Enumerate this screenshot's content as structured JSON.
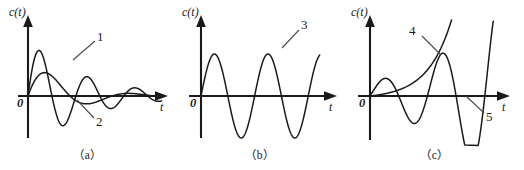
{
  "figure": {
    "background": "#ffffff",
    "ink_color": "#1a1a1a",
    "leader_color": "#4a4a52",
    "width": 524,
    "height": 170
  },
  "panels": [
    {
      "id": "a",
      "caption": "（a）",
      "y_axis_label": "c(t)",
      "x_axis_label": "t",
      "origin_label": "0",
      "curve_labels": [
        {
          "text": "1",
          "x": 97,
          "y": 36
        },
        {
          "text": "2",
          "x": 96,
          "y": 121
        }
      ],
      "description": "two damped oscillatory step responses decaying to zero"
    },
    {
      "id": "b",
      "caption": "（b）",
      "y_axis_label": "c(t)",
      "x_axis_label": "t",
      "origin_label": "0",
      "curve_labels": [
        {
          "text": "3",
          "x": 126,
          "y": 24
        }
      ],
      "description": "undamped constant-amplitude sinusoidal oscillation"
    },
    {
      "id": "c",
      "caption": "（c）",
      "y_axis_label": "c(t)",
      "x_axis_label": "t",
      "origin_label": "0",
      "curve_labels": [
        {
          "text": "4",
          "x": 64,
          "y": 30
        },
        {
          "text": "5",
          "x": 141,
          "y": 116
        }
      ],
      "description": "monotonically divergent curve and a divergent growing oscillation"
    }
  ],
  "chart_data": [
    {
      "type": "line",
      "panel": "a",
      "title": "(a)",
      "xlabel": "t",
      "ylabel": "c(t)",
      "grid": false,
      "axes": {
        "x0": 28,
        "y0": 96,
        "x_end": 166,
        "y_top": 18,
        "y_bottom": 138
      },
      "series": [
        {
          "name": "1",
          "model": "damped oscillation, low frequency, large damping",
          "amplitude": 38,
          "decay": 0.55,
          "omega": 3.05,
          "t_max": 6.3,
          "x_px_per_t": 21.2
        },
        {
          "name": "2",
          "model": "damped oscillation, higher frequency, light damping",
          "amplitude": 56,
          "decay": 0.38,
          "omega": 5.35,
          "t_max": 6.3,
          "x_px_per_t": 21.2
        }
      ]
    },
    {
      "type": "line",
      "panel": "b",
      "title": "(b)",
      "xlabel": "t",
      "ylabel": "c(t)",
      "grid": false,
      "axes": {
        "x0": 26,
        "y0": 96,
        "x_end": 160,
        "y_top": 18,
        "y_bottom": 138
      },
      "series": [
        {
          "name": "3",
          "model": "sustained sinusoid, constant amplitude",
          "amplitude": 42,
          "decay": 0,
          "omega": 5.0,
          "t_max": 5.3,
          "x_px_per_t": 22.4
        }
      ]
    },
    {
      "type": "line",
      "panel": "c",
      "title": "(c)",
      "xlabel": "t",
      "ylabel": "c(t)",
      "grid": false,
      "axes": {
        "x0": 25,
        "y0": 96,
        "x_end": 163,
        "y_top": 18,
        "y_bottom": 138
      },
      "series": [
        {
          "name": "4",
          "model": "monotonic exponential divergence",
          "amplitude": 2.6,
          "growth": 0.92,
          "t_max": 5.0,
          "x_px_per_t": 22.0
        },
        {
          "name": "5",
          "model": "divergent oscillation, growing amplitude",
          "amplitude": 14,
          "growth": 0.34,
          "omega": 4.3,
          "t_max": 5.6,
          "x_px_per_t": 22.0
        }
      ]
    }
  ]
}
